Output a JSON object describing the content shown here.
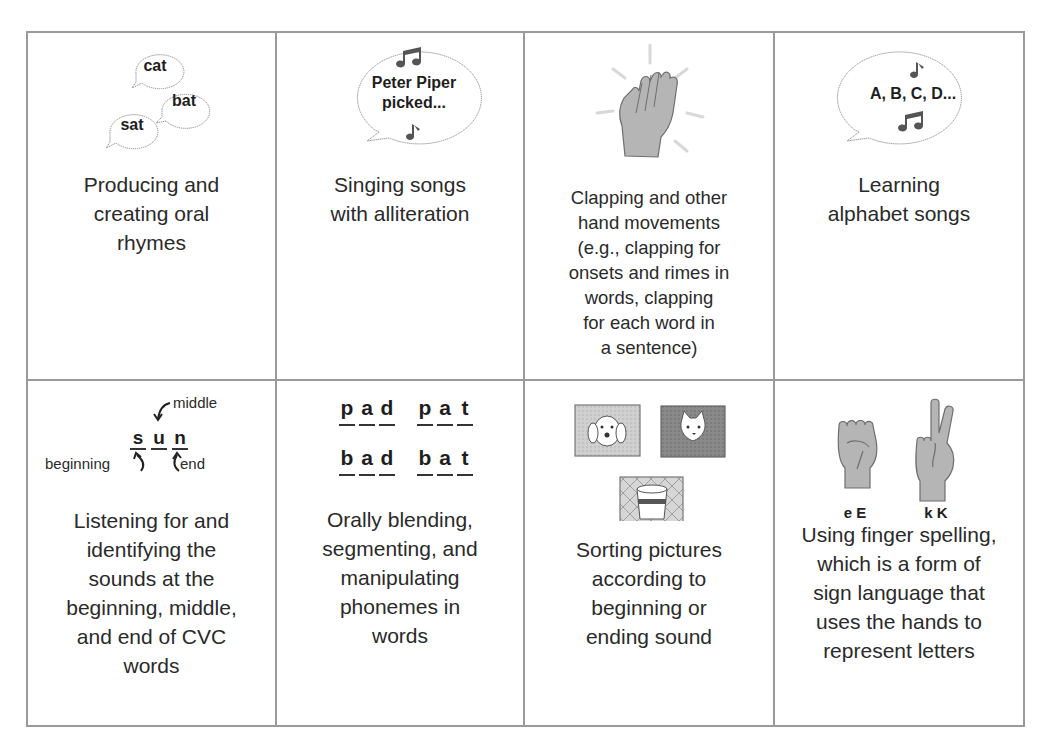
{
  "colors": {
    "grid_line": "#9a9a9a",
    "text": "#2a2a2a",
    "icon_fill": "#b5b5b5",
    "icon_stroke": "#6e6e6e"
  },
  "cells": [
    {
      "id": "rhymes",
      "icon": "speech-bubbles-rhyme-icon",
      "bubbles": [
        "cat",
        "bat",
        "sat"
      ],
      "caption_lines": [
        "Producing and",
        "creating oral",
        "rhymes"
      ]
    },
    {
      "id": "alliteration",
      "icon": "singing-bubble-icon",
      "bubble_lines": [
        "Peter Piper",
        "picked..."
      ],
      "caption_lines": [
        "Singing songs",
        "with alliteration"
      ]
    },
    {
      "id": "clapping",
      "icon": "clapping-hand-icon",
      "caption_lines": [
        "Clapping and other",
        "hand movements",
        "(e.g., clapping for",
        "onsets and rimes in",
        "words, clapping",
        "for each word in",
        "a sentence)"
      ]
    },
    {
      "id": "alphabet",
      "icon": "alphabet-song-bubble-icon",
      "bubble_lines": [
        "A, B, C, D..."
      ],
      "caption_lines": [
        "Learning",
        "alphabet songs"
      ]
    },
    {
      "id": "cvc-sounds",
      "icon": "sun-word-diagram-icon",
      "letters": [
        "s",
        "u",
        "n"
      ],
      "labels": {
        "beginning": "beginning",
        "middle": "middle",
        "end": "end"
      },
      "caption_lines": [
        "Listening for and",
        "identifying the",
        "sounds at the",
        "beginning, middle,",
        "and end of CVC",
        "words"
      ]
    },
    {
      "id": "phonemes",
      "icon": "letter-tiles-icon",
      "words": [
        [
          "p",
          "a",
          "d"
        ],
        [
          "p",
          "a",
          "t"
        ],
        [
          "b",
          "a",
          "d"
        ],
        [
          "b",
          "a",
          "t"
        ]
      ],
      "caption_lines": [
        "Orally blending,",
        "segmenting, and",
        "manipulating",
        "phonemes in",
        "words"
      ]
    },
    {
      "id": "sorting",
      "icon": "picture-cards-icon",
      "pictures": [
        "dog",
        "cat",
        "cup"
      ],
      "caption_lines": [
        "Sorting pictures",
        "according to",
        "beginning or",
        "ending sound"
      ]
    },
    {
      "id": "finger-spelling",
      "icon": "sign-language-hands-icon",
      "signs": [
        "e E",
        "k K"
      ],
      "caption_lines": [
        "Using finger spelling,",
        "which is a form of",
        "sign language that",
        "uses the hands to",
        "represent letters"
      ]
    }
  ]
}
